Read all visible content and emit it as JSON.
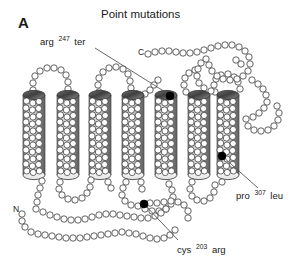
{
  "figure": {
    "panel_letter": "A",
    "title": "Point mutations",
    "diagram_type": "seven-transmembrane protein snake diagram",
    "helix_count": 7
  },
  "termini": {
    "n_terminus": "N",
    "c_terminus": "C"
  },
  "mutations": [
    {
      "id": "arg247ter",
      "residue_from": "arg",
      "position": "247",
      "residue_to": "ter",
      "label_text": "arg 247 ter",
      "location": "top of transmembrane helix 5",
      "marker_color": "#000000"
    },
    {
      "id": "pro307leu",
      "residue_from": "pro",
      "position": "307",
      "residue_to": "leu",
      "label_text": "pro 307 leu",
      "location": "lower part of transmembrane helix 7",
      "marker_color": "#000000"
    },
    {
      "id": "cys203arg",
      "residue_from": "cys",
      "position": "203",
      "residue_to": "arg",
      "label_text": "cys 203 arg",
      "location": "intracellular loop below helices",
      "marker_color": "#000000"
    }
  ],
  "colors": {
    "background": "#ffffff",
    "outline": "#333333",
    "residue_fill": "#ffffff",
    "helix_light": "#f0f0f0",
    "helix_mid": "#9a9a9a",
    "helix_dark": "#4a4a4a",
    "marker": "#000000",
    "leader_line": "#555555",
    "text": "#1a1a1a"
  }
}
